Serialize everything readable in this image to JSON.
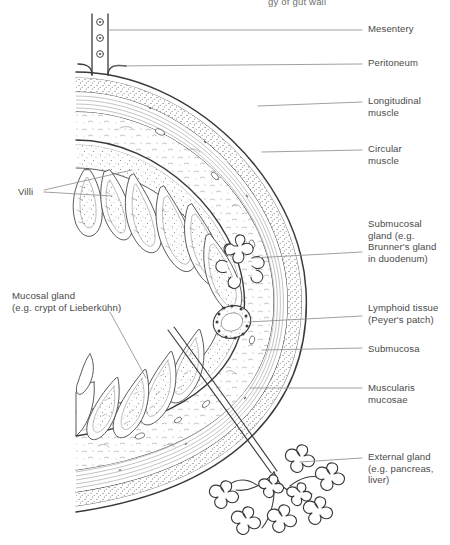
{
  "figure": {
    "title_partial": "gy of gut wall",
    "background_color": "#ffffff",
    "ink_color": "#333333",
    "leader_color": "#8f8f8f",
    "text_color": "#4a4a4a"
  },
  "labels_right": [
    {
      "id": "mesentery",
      "text": "Mesentery",
      "x": 368,
      "y": 27
    },
    {
      "id": "peritoneum",
      "text": "Peritoneum",
      "x": 368,
      "y": 61
    },
    {
      "id": "longitudinal-muscle",
      "text": "Longitudinal\nmuscle",
      "x": 368,
      "y": 96
    },
    {
      "id": "circular-muscle",
      "text": "Circular\nmuscle",
      "x": 368,
      "y": 144
    },
    {
      "id": "submucosal-gland",
      "text": "Submucosal\ngland (e.g.\nBrunner's gland\nin duodenum)",
      "x": 368,
      "y": 218
    },
    {
      "id": "lymphoid-tissue",
      "text": "Lymphoid tissue\n(Peyer's patch)",
      "x": 368,
      "y": 298
    },
    {
      "id": "submucosa",
      "text": "Submucosa",
      "x": 368,
      "y": 344
    },
    {
      "id": "muscularis-mucosae",
      "text": "Muscularis\nmucosae",
      "x": 368,
      "y": 381
    },
    {
      "id": "external-gland",
      "text": "External gland\n(e.g. pancreas,\nliver)",
      "x": 368,
      "y": 451
    }
  ],
  "labels_left": [
    {
      "id": "villi",
      "text": "Villi",
      "x": 18,
      "y": 189
    },
    {
      "id": "mucosal-gland",
      "text": "Mucosal gland\n(e.g. crypt of Lieberkühn)",
      "x": 12,
      "y": 292
    }
  ],
  "structures": [
    "mesentery",
    "peritoneum",
    "longitudinal muscle",
    "circular muscle",
    "submucosa",
    "muscularis mucosae",
    "mucosa with villi",
    "Brunner's gland",
    "Peyer's patch",
    "crypt of Lieberkühn",
    "external gland duct",
    "external gland acini"
  ]
}
